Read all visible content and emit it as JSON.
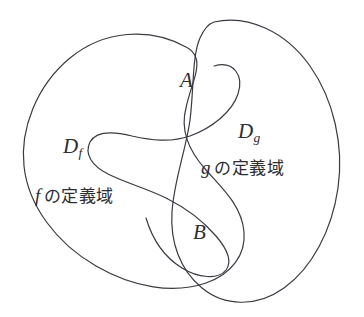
{
  "figure": {
    "type": "venn-diagram",
    "background_color": "#ffffff",
    "stroke_color": "#3a3a42",
    "stroke_width": 1.2,
    "shaded_fill_color": "#dfdfe0"
  },
  "labels": {
    "set_a": "A",
    "set_b": "B",
    "domain_f_symbol": "D",
    "domain_f_subscript": "f",
    "domain_g_symbol": "D",
    "domain_g_subscript": "g",
    "domain_f_text_fn": "f",
    "domain_f_text_jp": "の定義域",
    "domain_g_text_fn": "g",
    "domain_g_text_jp": "の定義域"
  },
  "regions": [
    {
      "name": "domain-f-blob",
      "label": "D_f",
      "caption": "f の定義域",
      "shaded": false
    },
    {
      "name": "domain-g-blob",
      "label": "D_g",
      "caption": "g の定義域",
      "shaded": false
    },
    {
      "name": "lobe-a",
      "label": "A",
      "shaded": true
    },
    {
      "name": "lobe-b",
      "label": "B",
      "shaded": false
    }
  ]
}
